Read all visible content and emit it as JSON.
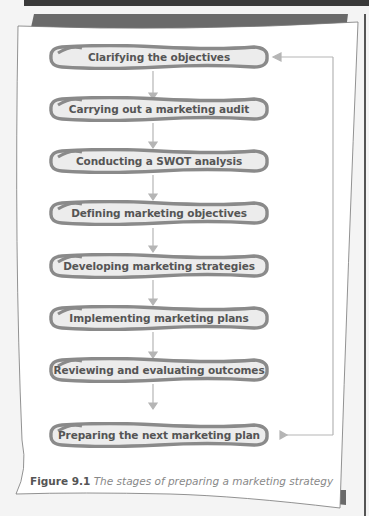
{
  "figure": {
    "stages": [
      {
        "label": "Clarifying the objectives"
      },
      {
        "label": "Carrying out a marketing audit"
      },
      {
        "label": "Conducting a SWOT analysis"
      },
      {
        "label": "Defining marketing objectives"
      },
      {
        "label": "Developing marketing strategies"
      },
      {
        "label": "Implementing marketing plans"
      },
      {
        "label": "Reviewing and evaluating outcomes"
      },
      {
        "label": "Preparing the next marketing plan"
      }
    ],
    "feedback_loop": "Preparing the next marketing plan → Clarifying the objectives",
    "caption": {
      "number": "Figure 9.1",
      "text": "The stages of preparing a marketing strategy"
    }
  },
  "colors": {
    "stage_fill": "#ececec",
    "stage_outline": "#8a8a8a",
    "arrow": "#b0b0b0",
    "text": "#555555",
    "frame_shadow": "#666666"
  }
}
